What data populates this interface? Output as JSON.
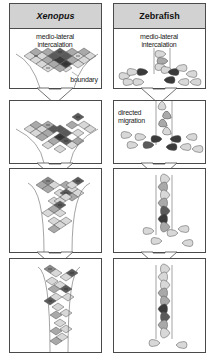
{
  "columns": [
    {
      "id": "xenopus",
      "title": "Xenopus",
      "title_style": "italic",
      "panels": [
        {
          "stage": 1,
          "labels": [
            "medio-lateral intercalation",
            "boundary"
          ]
        },
        {
          "stage": 2,
          "labels": []
        },
        {
          "stage": 3,
          "labels": []
        },
        {
          "stage": 4,
          "labels": []
        }
      ]
    },
    {
      "id": "zebrafish",
      "title": "Zebrafish",
      "title_style": "normal",
      "panels": [
        {
          "stage": 1,
          "labels": [
            "medio-lateral intercalation"
          ]
        },
        {
          "stage": 2,
          "labels": [
            "directed migration"
          ]
        },
        {
          "stage": 3,
          "labels": []
        },
        {
          "stage": 4,
          "labels": []
        }
      ]
    }
  ],
  "text": {
    "xenopus_title": "Xenopus",
    "zebrafish_title": "Zebrafish",
    "x_ml_1": "medio-lateral",
    "x_ml_2": "intercalation",
    "x_boundary": "boundary",
    "z_ml_1": "medio-lateral",
    "z_ml_2": "intercalation",
    "z_dm_1": "directed",
    "z_dm_2": "migration"
  },
  "colors": {
    "border": "#4a4a4a",
    "header_bg": "#d2d2d2",
    "cell_light": "#d8d8d8",
    "cell_mid": "#a9a9a9",
    "cell_dark": "#5a5a5a",
    "cell_darkest": "#3a3a3a",
    "arrow_fill": "#ffffff"
  },
  "icons": {
    "flow_arrow": "down-arrow-icon",
    "xenopus_cell": "diamond-cell-icon",
    "zebrafish_cell": "teardrop-cell-icon"
  }
}
